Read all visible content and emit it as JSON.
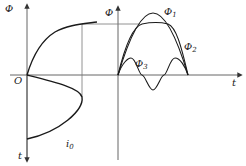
{
  "diagram": {
    "title": "",
    "left_panel": {
      "y_axis_top_label": "Φ",
      "y_axis_bottom_label": "t",
      "origin_label": "O",
      "current_label": "i",
      "current_subscript": "0",
      "curves": [
        "magnetization curve Φ(i)",
        "current waveform i(t)"
      ]
    },
    "right_panel": {
      "y_axis_label": "Φ",
      "x_axis_label": "t",
      "curves": [
        {
          "name": "Φ",
          "subscript": "1",
          "description": "fundamental sinusoidal flux"
        },
        {
          "name": "Φ",
          "subscript": "2",
          "description": "flat-topped flux"
        },
        {
          "name": "Φ",
          "subscript": "3",
          "description": "third harmonic flux"
        }
      ]
    },
    "colors": {
      "line": "#1a1a1a",
      "axis": "#555555",
      "background": "#ffffff"
    }
  }
}
